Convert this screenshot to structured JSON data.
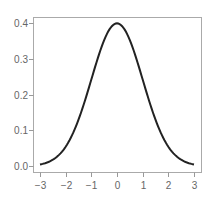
{
  "chart_data": {
    "type": "line",
    "title": "",
    "xlabel": "",
    "ylabel": "",
    "xlim": [
      -3,
      3
    ],
    "ylim": [
      0.0,
      0.4
    ],
    "grid": false,
    "legend": null,
    "x_ticks": [
      "−3",
      "−2",
      "−1",
      "0",
      "1",
      "2",
      "3"
    ],
    "x_tick_values": [
      -3,
      -2,
      -1,
      0,
      1,
      2,
      3
    ],
    "y_ticks": [
      "0.0",
      "0.1",
      "0.2",
      "0.3",
      "0.4"
    ],
    "y_tick_values": [
      0.0,
      0.1,
      0.2,
      0.3,
      0.4
    ],
    "series": [
      {
        "name": "standard normal density",
        "color": "#222222",
        "x": [
          -3,
          -2.5,
          -2,
          -1.5,
          -1,
          -0.5,
          0,
          0.5,
          1,
          1.5,
          2,
          2.5,
          3
        ],
        "y": [
          0.0044,
          0.0175,
          0.054,
          0.1295,
          0.242,
          0.3521,
          0.3989,
          0.3521,
          0.242,
          0.1295,
          0.054,
          0.0175,
          0.0044
        ]
      }
    ]
  },
  "colors": {
    "axis": "#999999",
    "curve": "#222222",
    "text": "#666666"
  }
}
